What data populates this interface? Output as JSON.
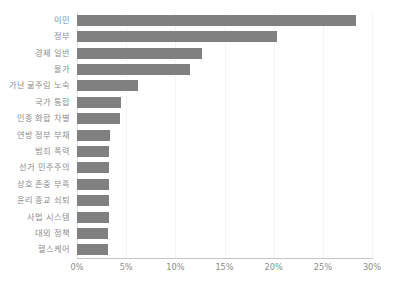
{
  "chart_data": {
    "type": "bar",
    "orientation": "horizontal",
    "title": "",
    "subtitle": "",
    "xlabel": "",
    "ylabel": "",
    "xlim": [
      0,
      30
    ],
    "grid": true,
    "legend": false,
    "legend_position": "none",
    "bar_color": "#808080",
    "gridline_color": "#f4f4f4",
    "axis_color": "#c4c4c4",
    "text_color": "#8c8c8c",
    "xticks": [
      0,
      5,
      10,
      15,
      20,
      25,
      30
    ],
    "xtick_labels": [
      "0%",
      "5%",
      "10%",
      "15%",
      "20%",
      "25%",
      "30%"
    ],
    "categories": [
      "이민",
      "정부",
      "경제 일반",
      "물가",
      "가난 굶주림 노숙",
      "국가 통합",
      "인종 화합 차별",
      "연방 정부 부채",
      "범죄 폭력",
      "선거 민주주의",
      "상호 존중 부족",
      "윤리 종교 쇠퇴",
      "사법 시스템",
      "대외 정책",
      "헬스케어"
    ],
    "values": [
      28.4,
      20.3,
      12.7,
      11.5,
      6.2,
      4.5,
      4.4,
      3.4,
      3.3,
      3.3,
      3.3,
      3.3,
      3.3,
      3.2,
      3.2
    ]
  }
}
